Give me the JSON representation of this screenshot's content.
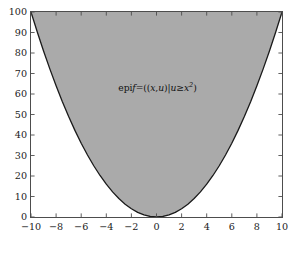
{
  "chart_data": {
    "type": "area",
    "title": "",
    "subtitle": "",
    "xlabel": "",
    "ylabel": "",
    "xlim": [
      -10,
      10
    ],
    "ylim": [
      0,
      100
    ],
    "grid": false,
    "legend": null,
    "frame": "box",
    "tick_direction": "in",
    "series": [
      {
        "name": "f(x) = x^2",
        "kind": "line",
        "color": "#1a1a1a",
        "linewidth": 1.3,
        "x": [
          -10,
          -9.5,
          -9,
          -8.5,
          -8,
          -7.5,
          -7,
          -6.5,
          -6,
          -5.5,
          -5,
          -4.5,
          -4,
          -3.5,
          -3,
          -2.5,
          -2,
          -1.5,
          -1,
          -0.5,
          0,
          0.5,
          1,
          1.5,
          2,
          2.5,
          3,
          3.5,
          4,
          4.5,
          5,
          5.5,
          6,
          6.5,
          7,
          7.5,
          8,
          8.5,
          9,
          9.5,
          10
        ],
        "y": [
          100,
          90.25,
          81,
          72.25,
          64,
          56.25,
          49,
          42.25,
          36,
          30.25,
          25,
          20.25,
          16,
          12.25,
          9,
          6.25,
          4,
          2.25,
          1,
          0.25,
          0,
          0.25,
          1,
          2.25,
          4,
          6.25,
          9,
          12.25,
          16,
          20.25,
          25,
          30.25,
          36,
          42.25,
          49,
          56.25,
          64,
          72.25,
          81,
          90.25,
          100
        ]
      },
      {
        "name": "epigraph of f",
        "kind": "fill_between",
        "fill_color": "#aaaaaa",
        "lower": "x^2",
        "upper": 100
      }
    ],
    "xticks": [
      -10,
      -8,
      -6,
      -4,
      -2,
      0,
      2,
      4,
      6,
      8,
      10
    ],
    "xtick_labels": [
      "−10",
      "−8",
      "−6",
      "−4",
      "−2",
      "0",
      "2",
      "4",
      "6",
      "8",
      "10"
    ],
    "yticks": [
      0,
      10,
      20,
      30,
      40,
      50,
      60,
      70,
      80,
      90,
      100
    ],
    "ytick_labels": [
      "0",
      "10",
      "20",
      "30",
      "40",
      "50",
      "60",
      "70",
      "80",
      "90",
      "100"
    ],
    "annotations": [
      {
        "name": "epigraph-label",
        "x": 0,
        "y": 62,
        "text": "epi f = ((x,u) | u ≥ x²)",
        "parts": {
          "epi": "epi",
          "f": "f",
          "eq": "=",
          "open": "((",
          "x": "x",
          "comma": ",",
          "u": "u",
          "close_inner": ")",
          "bar": "|",
          "u2": "u",
          "geq": "≥",
          "x2": "x",
          "exp": "2",
          "close": ")"
        }
      }
    ]
  },
  "colors": {
    "fill": "#aaaaaa",
    "curve": "#1a1a1a",
    "frame": "#4d4d4d",
    "background": "#ffffff",
    "tick_label": "#1a1a1a"
  }
}
